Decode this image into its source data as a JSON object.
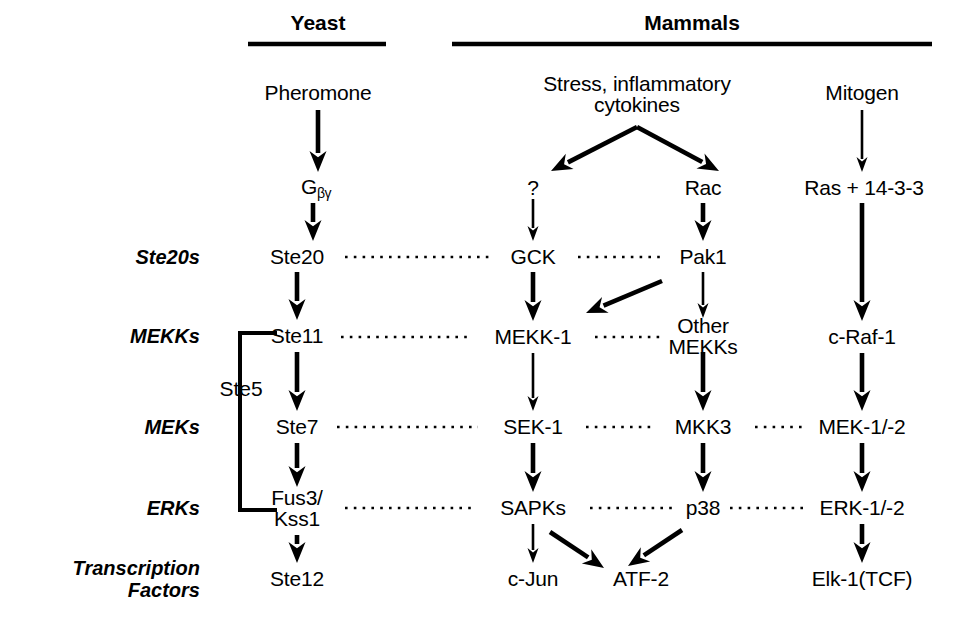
{
  "figure": {
    "type": "pathway-diagram",
    "title_columns": [
      {
        "id": "yeast",
        "label": "Yeast",
        "rule": {
          "x1": 248,
          "x2": 386,
          "y": 44
        },
        "label_x": 318,
        "label_y": 23
      },
      {
        "id": "mammals",
        "label": "Mammals",
        "rule": {
          "x1": 452,
          "x2": 932,
          "y": 44
        },
        "label_x": 692,
        "label_y": 23
      }
    ],
    "row_labels": [
      {
        "id": "ste20s",
        "label": "Ste20s",
        "x": 200,
        "y": 257
      },
      {
        "id": "mekks",
        "label": "MEKKs",
        "x": 200,
        "y": 336
      },
      {
        "id": "meks",
        "label": "MEKs",
        "x": 200,
        "y": 427
      },
      {
        "id": "erks",
        "label": "ERKs",
        "x": 200,
        "y": 508
      },
      {
        "id": "transcription-factors",
        "label": "Transcription\nFactors",
        "line1": "Transcription",
        "line2": "Factors",
        "x": 200,
        "y": 579
      }
    ],
    "nodes": [
      {
        "id": "pheromone",
        "label": "Pheromone",
        "x": 318,
        "y": 93
      },
      {
        "id": "gbg",
        "label": "G",
        "sub": "βγ",
        "x": 316,
        "y": 188
      },
      {
        "id": "ste20",
        "label": "Ste20",
        "x": 297,
        "y": 257
      },
      {
        "id": "ste11",
        "label": "Ste11",
        "x": 297,
        "y": 336
      },
      {
        "id": "ste7",
        "label": "Ste7",
        "x": 297,
        "y": 427
      },
      {
        "id": "fus3kss1",
        "line1": "Fus3/",
        "line2": "Kss1",
        "x": 297,
        "y": 508
      },
      {
        "id": "ste12",
        "label": "Ste12",
        "x": 297,
        "y": 579
      },
      {
        "id": "stress-cytokines",
        "line1": "Stress, inflammatory",
        "line2": "cytokines",
        "x": 637,
        "y": 94
      },
      {
        "id": "question",
        "label": "?",
        "x": 533,
        "y": 188
      },
      {
        "id": "rac",
        "label": "Rac",
        "x": 703,
        "y": 188
      },
      {
        "id": "gck",
        "label": "GCK",
        "x": 533,
        "y": 257
      },
      {
        "id": "pak1",
        "label": "Pak1",
        "x": 703,
        "y": 257
      },
      {
        "id": "mekk1",
        "label": "MEKK-1",
        "x": 533,
        "y": 337
      },
      {
        "id": "other-mekks",
        "line1": "Other",
        "line2": "MEKKs",
        "x": 703,
        "y": 336
      },
      {
        "id": "sek1",
        "label": "SEK-1",
        "x": 533,
        "y": 427
      },
      {
        "id": "mkk3",
        "label": "MKK3",
        "x": 703,
        "y": 427
      },
      {
        "id": "sapks",
        "label": "SAPKs",
        "x": 533,
        "y": 508
      },
      {
        "id": "p38",
        "label": "p38",
        "x": 703,
        "y": 508
      },
      {
        "id": "c-jun",
        "label": "c-Jun",
        "x": 533,
        "y": 579
      },
      {
        "id": "atf2",
        "label": "ATF-2",
        "x": 641,
        "y": 579
      },
      {
        "id": "mitogen",
        "label": "Mitogen",
        "x": 862,
        "y": 93
      },
      {
        "id": "ras-1433",
        "label": "Ras + 14-3-3",
        "x": 864,
        "y": 188
      },
      {
        "id": "c-raf-1",
        "label": "c-Raf-1",
        "x": 862,
        "y": 337
      },
      {
        "id": "mek-1-2",
        "label": "MEK-1/-2",
        "x": 862,
        "y": 427
      },
      {
        "id": "erk-1-2",
        "label": "ERK-1/-2",
        "x": 862,
        "y": 508
      },
      {
        "id": "elk1-tcf",
        "label": "Elk-1(TCF)",
        "x": 862,
        "y": 579
      }
    ],
    "bracket": {
      "id": "ste5-bracket",
      "label": "Ste5",
      "x_spine": 240,
      "x_arm_end": 277,
      "y_top": 333,
      "y_bottom": 510,
      "label_x": 241,
      "label_y": 389
    },
    "arrows": [
      {
        "from": "pheromone",
        "to": "gbg",
        "x1": 318,
        "y1": 110,
        "x2": 318,
        "y2": 172,
        "weight": "thick"
      },
      {
        "from": "gbg",
        "to": "ste20",
        "x1": 313,
        "y1": 203,
        "x2": 313,
        "y2": 241,
        "weight": "thick"
      },
      {
        "from": "ste20",
        "to": "ste11",
        "x1": 297,
        "y1": 272,
        "x2": 297,
        "y2": 320,
        "weight": "thick"
      },
      {
        "from": "ste11",
        "to": "ste7",
        "x1": 297,
        "y1": 352,
        "x2": 297,
        "y2": 411,
        "weight": "thick"
      },
      {
        "from": "ste7",
        "to": "fus3kss1",
        "x1": 297,
        "y1": 443,
        "x2": 297,
        "y2": 487,
        "weight": "thick"
      },
      {
        "from": "fus3kss1",
        "to": "ste12",
        "x1": 297,
        "y1": 535,
        "x2": 297,
        "y2": 563,
        "weight": "thick"
      },
      {
        "from": "stress-cytokines",
        "to": "question",
        "x1": 637,
        "y1": 127,
        "x2": 551,
        "y2": 171,
        "weight": "thick"
      },
      {
        "from": "stress-cytokines",
        "to": "rac",
        "x1": 637,
        "y1": 127,
        "x2": 719,
        "y2": 171,
        "weight": "thick"
      },
      {
        "from": "question",
        "to": "gck",
        "x1": 533,
        "y1": 199,
        "x2": 533,
        "y2": 241,
        "weight": "thin"
      },
      {
        "from": "rac",
        "to": "pak1",
        "x1": 703,
        "y1": 203,
        "x2": 703,
        "y2": 241,
        "weight": "thick"
      },
      {
        "from": "gck",
        "to": "mekk1",
        "x1": 533,
        "y1": 272,
        "x2": 533,
        "y2": 321,
        "weight": "thick"
      },
      {
        "from": "pak1",
        "to": "mekk1",
        "x1": 662,
        "y1": 281,
        "x2": 586,
        "y2": 313,
        "weight": "thick"
      },
      {
        "from": "pak1",
        "to": "other-mekks",
        "x1": 703,
        "y1": 272,
        "x2": 703,
        "y2": 318,
        "weight": "thin"
      },
      {
        "from": "mekk1",
        "to": "sek1",
        "x1": 533,
        "y1": 353,
        "x2": 533,
        "y2": 411,
        "weight": "thin"
      },
      {
        "from": "other-mekks",
        "to": "mkk3",
        "x1": 703,
        "y1": 352,
        "x2": 703,
        "y2": 411,
        "weight": "thick"
      },
      {
        "from": "sek1",
        "to": "sapks",
        "x1": 533,
        "y1": 443,
        "x2": 533,
        "y2": 492,
        "weight": "thick"
      },
      {
        "from": "mkk3",
        "to": "p38",
        "x1": 703,
        "y1": 443,
        "x2": 703,
        "y2": 492,
        "weight": "thick"
      },
      {
        "from": "sapks",
        "to": "c-jun",
        "x1": 533,
        "y1": 524,
        "x2": 533,
        "y2": 563,
        "weight": "thin"
      },
      {
        "from": "sapks",
        "to": "atf2",
        "x1": 550,
        "y1": 532,
        "x2": 604,
        "y2": 568,
        "weight": "thick"
      },
      {
        "from": "p38",
        "to": "atf2",
        "x1": 682,
        "y1": 530,
        "x2": 628,
        "y2": 566,
        "weight": "thick"
      },
      {
        "from": "mitogen",
        "to": "ras-1433",
        "x1": 862,
        "y1": 110,
        "x2": 862,
        "y2": 172,
        "weight": "thin"
      },
      {
        "from": "ras-1433",
        "to": "c-raf-1",
        "x1": 862,
        "y1": 203,
        "x2": 862,
        "y2": 321,
        "weight": "thick"
      },
      {
        "from": "c-raf-1",
        "to": "mek-1-2",
        "x1": 862,
        "y1": 353,
        "x2": 862,
        "y2": 411,
        "weight": "thick"
      },
      {
        "from": "mek-1-2",
        "to": "erk-1-2",
        "x1": 862,
        "y1": 443,
        "x2": 862,
        "y2": 492,
        "weight": "thick"
      },
      {
        "from": "erk-1-2",
        "to": "elk1-tcf",
        "x1": 862,
        "y1": 524,
        "x2": 862,
        "y2": 563,
        "weight": "thick"
      }
    ],
    "dotted_links": [
      {
        "from": "ste20",
        "to": "gck",
        "x1": 345,
        "y1": 257,
        "x2": 490,
        "y2": 257
      },
      {
        "from": "gck",
        "to": "pak1",
        "x1": 578,
        "y1": 257,
        "x2": 660,
        "y2": 257
      },
      {
        "from": "ste11",
        "to": "mekk1",
        "x1": 341,
        "y1": 337,
        "x2": 470,
        "y2": 337
      },
      {
        "from": "mekk1",
        "to": "other-mekks",
        "x1": 595,
        "y1": 337,
        "x2": 660,
        "y2": 337
      },
      {
        "from": "ste7",
        "to": "sek1",
        "x1": 337,
        "y1": 427,
        "x2": 478,
        "y2": 427
      },
      {
        "from": "sek1",
        "to": "mkk3",
        "x1": 586,
        "y1": 427,
        "x2": 655,
        "y2": 427
      },
      {
        "from": "mkk3",
        "to": "mek-1-2",
        "x1": 755,
        "y1": 427,
        "x2": 806,
        "y2": 427
      },
      {
        "from": "fus3kss1",
        "to": "sapks",
        "x1": 345,
        "y1": 508,
        "x2": 476,
        "y2": 508
      },
      {
        "from": "sapks",
        "to": "p38",
        "x1": 590,
        "y1": 508,
        "x2": 678,
        "y2": 508
      },
      {
        "from": "p38",
        "to": "erk-1-2",
        "x1": 730,
        "y1": 508,
        "x2": 804,
        "y2": 508
      }
    ],
    "colors": {
      "ink": "#000000",
      "background": "#ffffff"
    }
  }
}
